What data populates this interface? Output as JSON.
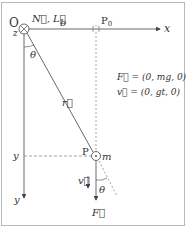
{
  "diagram": {
    "origin_label": "O",
    "z_label": "z",
    "origin_vectors_label": "N⃗, L⃗",
    "x_axis_label": "x",
    "y_axis_label": "y",
    "distance_label": "b",
    "p0_label": "P",
    "p0_subscript": "0",
    "p_label": "P",
    "mass_label": "m",
    "position_vector_label": "r⃗",
    "angle_top_label": "θ",
    "angle_bottom_label": "θ",
    "y_marker_label": "y",
    "velocity_label": "v⃗",
    "force_label": "F⃗",
    "equations": [
      "F⃗ = (0, mg, 0)",
      "v⃗ = (0, gt, 0)"
    ],
    "colors": {
      "line": "#444444",
      "dashed": "#888888",
      "frame": "#b8b8b8"
    }
  }
}
